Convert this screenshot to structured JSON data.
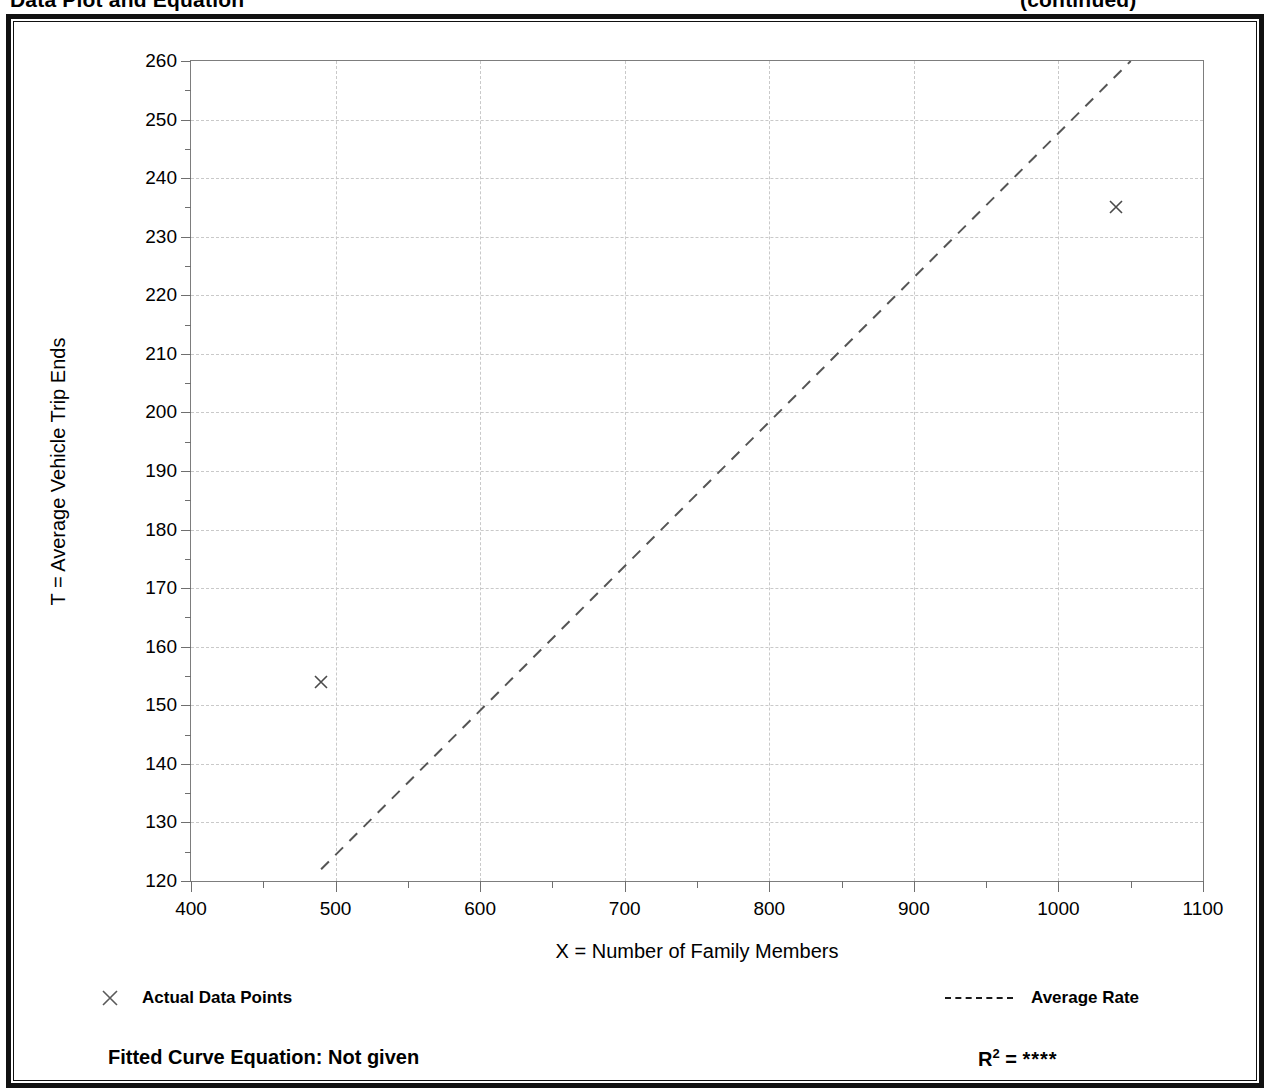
{
  "document": {
    "title_left": "Data Plot and Equation",
    "title_right": "(continued)"
  },
  "axis_titles": {
    "y": "T = Average Vehicle Trip Ends",
    "x": "X = Number of Family Members"
  },
  "legend": {
    "data_points_label": "Actual Data Points",
    "data_points_marker": "x-marker-icon",
    "average_rate_label": "Average Rate",
    "average_rate_marker": "dashed-line-icon"
  },
  "footer": {
    "equation_label": "Fitted Curve Equation:  Not given",
    "r2_symbol": "R",
    "r2_exponent": "2",
    "r2_equals": " = ",
    "r2_value": "****"
  },
  "chart_data": {
    "type": "scatter",
    "title": "Data Plot and Equation",
    "xlabel": "X = Number of Family Members",
    "ylabel": "T = Average Vehicle Trip Ends",
    "xlim": [
      400,
      1100
    ],
    "ylim": [
      120,
      260
    ],
    "x_major_ticks": [
      400,
      500,
      600,
      700,
      800,
      900,
      1000,
      1100
    ],
    "x_minor_step": 50,
    "y_major_ticks": [
      120,
      130,
      140,
      150,
      160,
      170,
      180,
      190,
      200,
      210,
      220,
      230,
      240,
      250,
      260
    ],
    "y_minor_step": 5,
    "grid": true,
    "legend_position": "below-axes",
    "series": [
      {
        "name": "Actual Data Points",
        "type": "scatter",
        "marker": "x",
        "color": "#4a4a4a",
        "points": [
          {
            "x": 490,
            "y": 154
          },
          {
            "x": 1040,
            "y": 235
          }
        ]
      },
      {
        "name": "Average Rate",
        "type": "line",
        "style": "dashed",
        "color": "#555555",
        "points": [
          {
            "x": 490,
            "y": 122
          },
          {
            "x": 1050,
            "y": 260
          }
        ]
      }
    ]
  }
}
